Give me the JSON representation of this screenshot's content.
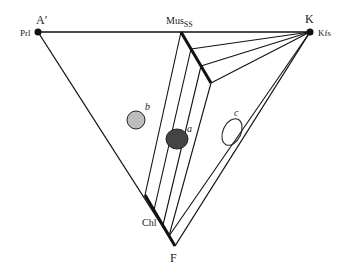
{
  "diagram": {
    "type": "ternary phase diagram (AKF)",
    "vertices": {
      "top_left": {
        "label": "A′",
        "mineral": "Prl"
      },
      "top_right": {
        "label": "K",
        "mineral": "Kfs"
      },
      "bottom": {
        "label": "F"
      }
    },
    "phases": {
      "muscovite": {
        "label": "Mus",
        "subscript": "SS"
      },
      "chlorite": {
        "label": "Chl"
      }
    },
    "fields": [
      {
        "label": "b",
        "fill": "#bdbdbd"
      },
      {
        "label": "a",
        "fill": "#444444"
      },
      {
        "label": "c",
        "fill": "none"
      }
    ]
  }
}
